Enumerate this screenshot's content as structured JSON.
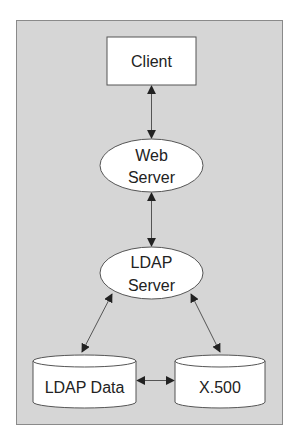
{
  "diagram": {
    "colors": {
      "panel_bg": "#d6d6d6",
      "node_fill": "#ffffff",
      "stroke": "#555555",
      "text": "#222222"
    },
    "nodes": [
      {
        "id": "client",
        "shape": "rectangle",
        "label": "Client"
      },
      {
        "id": "web_server",
        "shape": "ellipse",
        "label_line1": "Web",
        "label_line2": "Server"
      },
      {
        "id": "ldap_server",
        "shape": "ellipse",
        "label_line1": "LDAP",
        "label_line2": "Server"
      },
      {
        "id": "ldap_data",
        "shape": "cylinder",
        "label": "LDAP Data"
      },
      {
        "id": "x500",
        "shape": "cylinder",
        "label": "X.500"
      }
    ],
    "edges": [
      {
        "from": "client",
        "to": "web_server",
        "direction": "bidirectional"
      },
      {
        "from": "web_server",
        "to": "ldap_server",
        "direction": "bidirectional"
      },
      {
        "from": "ldap_server",
        "to": "ldap_data",
        "direction": "bidirectional"
      },
      {
        "from": "ldap_server",
        "to": "x500",
        "direction": "bidirectional"
      },
      {
        "from": "ldap_data",
        "to": "x500",
        "direction": "bidirectional"
      }
    ]
  }
}
